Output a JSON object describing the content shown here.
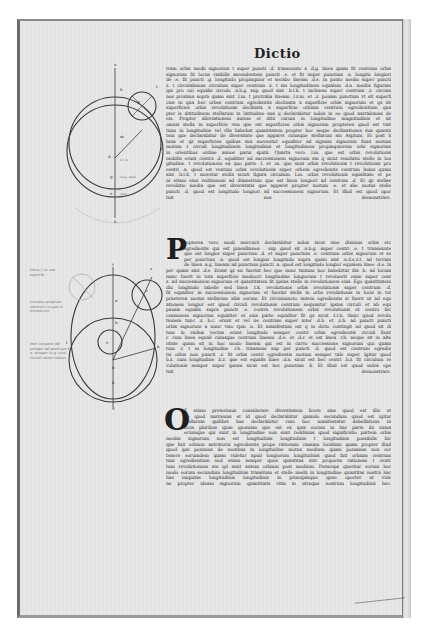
{
  "page": {
    "running_head": "Dictio",
    "paper_color": "#e4e4e4",
    "ink_color": "#2b2b2b"
  },
  "text": {
    "block_1": [
      "tram orbis medii signorum t super puncti .d. transeunte a .d.g. linea quam fit centrum orbis",
      "signorum fit locus visibilis ascendentem puncti .e. et fit super punctum .a. longitu longiori",
      "de .e. fit puncti .g. longitudo propinquior et secabo lineam .d.e. in ponto medio super puncti",
      "z. t circulabimus circulum super centrum .z. t sm longitudinem equalem .d.a. mediis figuram",
      "qui pro cui equalis circulo .a.b.g. sup quod sint .h.t.k. t inclinem super centrum .z. circum",
      "nos proxima sopra quam sint .l.m. t protraba lineam .l.z.m. et .z. ponam punctum vt sit superfi",
      "cies in qua hec orbes centrum egredientis declinata a superficie orbis signorum et qz sit",
      "superficies orbis revolutionis declinata a superficie orbium centrum egredientium qua",
      "pter is altitudinem stellarum in latitudine sua q declarabitur nobis in eo quod narrabimus de",
      "eis. Propter alleviationem autem et ditii carum in longitudine magnitudinis et sit",
      "omnis stella in superficie vna que est superficies orbis signorum propterea quod est vnit",
      "tium in longitudine vel vlla habebat quantitatem propter hoc neque declinationes sua quanta",
      "tem que declarabitur de diversitate que apparet cuiusque stellarum sm Asptum. Et post h",
      "luna et qz superficies quibus sua moventur equaliter ad signum signorum fiunt motum",
      "motum t circuli longitudinem longitudinis et longitudinem propinquiorem orbi signorum",
      "in orientibus ordine annos parui spatii. Quarta vero .l.m. que est orbis revolutionis",
      "mobilis erunt centra .d. equaliter ad successionem signorum sm q sicut reuolutio stelle in lon",
      "gitudine. t revolutionem ea quo parte .l. et .m. que sunt orbis revolutionis t revolutionis pro",
      "centri .a. quod est ventum orbis revolutionis super orbem egredientis centrum huius quam",
      "sint .h.t.k. t movetur stella sicuti figura circulum. Lm. orbis revolutionis equalitate et pe",
      "ni etiam eius reditionem ad diametrum que est linea longiori ad centrum .d. Et qz stellae",
      "revolutio media que est diversitatis que apparet propter motum .e. et alie motus stelle",
      "puncti .d. quod est longitudo longiori ad successionem signorum. Et illud est quod opor",
      "tuit nos demonstrare."
    ],
    "block_2": [
      "ropterea vero modi mercurii declarabitur nobis sicut sine diximus orbis etc",
      "egredientis qui est pineallianea . sup quod sit .a.b.g. super centri .e. t transeunte",
      "que est longior super punctum .d. et super punctum .e. centrum orbis signorum et se",
      "per punctum .a. quod est longius longitudo supra quam sint .a.d.e.z.t. ad terram",
      "de linea .a.g. lineam ad punctum puncti .a. quod est longitudo longior equalem linee .d.e. la",
      "per quam sint .d.e. Erunt qz sic fuerint hec que nunc tantum hoc habebitur illa .h. ad locum",
      "nunc fuerit in tota superficie mediocri longitudine longiorum t revoluerit enim super cent",
      "z. ad successionem signorum et quantitatem fit ipsius stelle in revolutionem eius. Ego quantitatem",
      "diu longitudo tabelle sed linea .t.k. revolutionis orbis revolutionis super centrum .d.",
      "fit equaliter in successionem signorum et fuerint stella in orbe revolutionis in locis in tot",
      "praeterea motus stellarum aliis eorum. Et circumuncto autem egredientis si fuerit ut ad equ",
      "ationem longior est quod circuli revolutionis centrum sequantur ipsius circuli et ab equ",
      "pausis equalis supra puncti .e. contra revolutionem orbis revolutionis et centro hic",
      "cessionem signorum equaliter et eius parte equaliter fit qz sicut .t.t.h. thuic quod revolu",
      "tionem tunc .z. h.c. erunt et vel ne centrum super inter .d.b. et .z.h. ad puncti puncti",
      "orbis signorum a nunc viso rpm .n. Et manifestum est q in dicto contingit ad quod sit di",
      "tum in radius vectus eruat longitudo semper centri orbis egredientis circuli fiunt",
      "r. cum linea equali cuiusque centrum lineam .d.e. et .d.r. et est linea .r.h. neque sit in alte",
      "ritate quam sit in hoc modo lineam qui est in curvo successione signorum qui quam",
      "tum .r. t m longitudine .r.h. transiens sup per puncti .d. quod est centrum egredie",
      "tis orbis non puncti .z. fit orbis centri egredientis motum semper tale super. Igitur quod",
      "b.z. cum longitudine .b.z. que est equalis linee .d.a. sicut est hec centri .b.z. fit circulum re",
      "volutionis semper super ipsum sicut est hec punctum .k. Et illud est quod nobis ope",
      "tuit demonstrare."
    ],
    "block_3": [
      "T etiam preterimus considerare diversitatem licere sine quod est illic et",
      "eo quod narramus et id quod declarabitur quando secundum quod est igitur",
      "stellarum quilibet has declarabitur cum hoc manifestatur debellatione in",
      "locis pluribus quae quoniam que est ex ipsa eorum in hac parte ibi suma",
      "eciuisque qui sunt in longitudine non sunt reddimus quod significatio partem orbis",
      "mediis signorum non est longitudinis longitudinis t longitudinis possibilis hic",
      "que fuit orbium antratoria egredientis prope rationum causam localium quam propter illud",
      "quod ipsi ponimus de motibus in longitudine motus medium quam ponamus non cor",
      "tenere eorumdem quam videtur apud longiorum longitudinis quod fuit orbium centrum",
      "tum egredientium sed etiam semper quos quantitas sint proporsa rationem t centr",
      "tum revolutionum sm qd sunt autem orbium post medium. Deinceps queritur eorum hoc",
      "modo eorum secundum longitudinis transitum et stelle medii in longitudine quantitas nostra hac",
      "has iniquitas longitudinis longitudinis in principiisque quae oportet ut vide",
      "ne propter ideam signorum quantitatis vitia in utraque nostrum longitudinis hec."
    ]
  },
  "dropcaps": {
    "p": "P",
    "o": "O"
  },
  "diagram_1": {
    "labels": [
      "a",
      "h",
      "t",
      "z",
      "k",
      "m",
      "d",
      "g",
      "e",
      "b",
      "l"
    ],
    "annotations": [
      "h t  m",
      "long. medi",
      "cent."
    ]
  },
  "diagram_2": {
    "labels": [
      "t",
      "a",
      "h",
      "d",
      "b",
      "e",
      "g",
      "k",
      "z",
      "r"
    ]
  },
  "margin_notes": {
    "note_1": "locus f. in vno epiciclo",
    "note_2": "circulus proprius mercurii in que in eccentrico",
    "note_3": "Hoc tempore dd semper ad punctum b a. semper in q. sunt circuli minor motus"
  }
}
